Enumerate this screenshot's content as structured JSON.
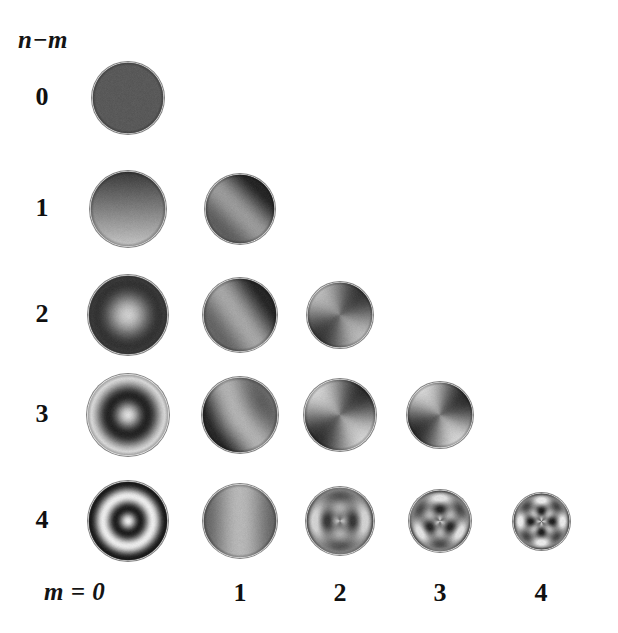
{
  "figure": {
    "type": "zernike-pyramid",
    "background_color": "#ffffff",
    "ink_color": "#101010",
    "width": 618,
    "height": 633
  },
  "axes": {
    "row_axis_title": "n−m",
    "col_axis_title": "m = 0",
    "row_ticks": [
      "0",
      "1",
      "2",
      "3",
      "4"
    ],
    "col_ticks": [
      "0",
      "1",
      "2",
      "3",
      "4"
    ],
    "col_tick_labels_shown": [
      "1",
      "2",
      "3",
      "4"
    ]
  },
  "grid": {
    "rows": 5,
    "cols": 5,
    "row_label_x": 42,
    "col_centers": [
      128,
      240,
      340,
      440,
      541
    ],
    "row_centers": [
      98,
      209,
      315,
      415,
      521
    ],
    "diameters": [
      [
        72,
        0,
        0,
        0,
        0
      ],
      [
        76,
        70,
        0,
        0,
        0
      ],
      [
        80,
        74,
        66,
        0,
        0
      ],
      [
        82,
        76,
        72,
        66,
        0
      ],
      [
        80,
        74,
        68,
        62,
        57
      ]
    ]
  },
  "chart_data": {
    "type": "heatmap",
    "title": "",
    "xlabel": "m",
    "ylabel": "n−m",
    "categories_x": [
      "0",
      "1",
      "2",
      "3",
      "4"
    ],
    "categories_y": [
      "0",
      "1",
      "2",
      "3",
      "4"
    ],
    "colormap": "grayscale",
    "value_range": [
      -1,
      1
    ],
    "cells": [
      {
        "row": 0,
        "col": 0,
        "n": 0,
        "m": 0,
        "name": "piston",
        "pattern": "uniform",
        "radial_order": 0,
        "azimuthal_order": 0,
        "radial_nodes": 0,
        "angular_lobes": 0,
        "mean_gray": 0.35,
        "contrast": 0.02,
        "phase_deg": 0
      },
      {
        "row": 1,
        "col": 0,
        "n": 1,
        "m": 0,
        "name": "tilt-vertical",
        "pattern": "linear-gradient",
        "radial_order": 1,
        "azimuthal_order": 0,
        "radial_nodes": 1,
        "angular_lobes": 0,
        "mean_gray": 0.5,
        "contrast": 0.55,
        "phase_deg": 90
      },
      {
        "row": 1,
        "col": 1,
        "n": 2,
        "m": 1,
        "name": "tilt-oblique",
        "pattern": "angular-band",
        "radial_order": 0,
        "azimuthal_order": 1,
        "radial_nodes": 0,
        "angular_lobes": 1,
        "mean_gray": 0.42,
        "contrast": 0.55,
        "phase_deg": 135
      },
      {
        "row": 2,
        "col": 0,
        "n": 2,
        "m": 0,
        "name": "defocus",
        "pattern": "radial-band",
        "radial_order": 1,
        "azimuthal_order": 0,
        "radial_nodes": 1,
        "angular_lobes": 0,
        "mean_gray": 0.5,
        "contrast": 0.6,
        "phase_deg": 90
      },
      {
        "row": 2,
        "col": 1,
        "n": 3,
        "m": 1,
        "name": "coma-oblique",
        "pattern": "angular-band",
        "radial_order": 1,
        "azimuthal_order": 1,
        "radial_nodes": 0,
        "angular_lobes": 1,
        "mean_gray": 0.45,
        "contrast": 0.6,
        "phase_deg": 145
      },
      {
        "row": 2,
        "col": 2,
        "n": 4,
        "m": 2,
        "name": "astigmatism-oblique",
        "pattern": "angular-cross",
        "radial_order": 0,
        "azimuthal_order": 2,
        "radial_nodes": 0,
        "angular_lobes": 2,
        "mean_gray": 0.47,
        "contrast": 0.55,
        "phase_deg": 45
      },
      {
        "row": 3,
        "col": 0,
        "n": 3,
        "m": 0,
        "name": "spherical-low",
        "pattern": "radial-band",
        "radial_order": 2,
        "azimuthal_order": 0,
        "radial_nodes": 2,
        "angular_lobes": 0,
        "mean_gray": 0.5,
        "contrast": 0.72,
        "phase_deg": 90
      },
      {
        "row": 3,
        "col": 1,
        "n": 4,
        "m": 1,
        "name": "coma-higher",
        "pattern": "angular-band",
        "radial_order": 2,
        "azimuthal_order": 1,
        "radial_nodes": 1,
        "angular_lobes": 1,
        "mean_gray": 0.48,
        "contrast": 0.65,
        "phase_deg": 150
      },
      {
        "row": 3,
        "col": 2,
        "n": 5,
        "m": 2,
        "name": "astigmatism-higher",
        "pattern": "angular-cross",
        "radial_order": 1,
        "azimuthal_order": 2,
        "radial_nodes": 0,
        "angular_lobes": 2,
        "mean_gray": 0.5,
        "contrast": 0.68,
        "phase_deg": 45
      },
      {
        "row": 3,
        "col": 3,
        "n": 6,
        "m": 3,
        "name": "trefoil",
        "pattern": "angular-cross-offset",
        "radial_order": 1,
        "azimuthal_order": 2,
        "radial_nodes": 0,
        "angular_lobes": 2,
        "mean_gray": 0.5,
        "contrast": 0.7,
        "phase_deg": 55
      },
      {
        "row": 4,
        "col": 0,
        "n": 4,
        "m": 0,
        "name": "spherical-aberration",
        "pattern": "radial-band",
        "radial_order": 3,
        "azimuthal_order": 0,
        "radial_nodes": 3,
        "angular_lobes": 0,
        "mean_gray": 0.52,
        "contrast": 0.8,
        "phase_deg": 90
      },
      {
        "row": 4,
        "col": 1,
        "n": 5,
        "m": 1,
        "name": "coma-highest",
        "pattern": "angular-band-soft",
        "radial_order": 3,
        "azimuthal_order": 1,
        "radial_nodes": 1,
        "angular_lobes": 1,
        "mean_gray": 0.55,
        "contrast": 0.42,
        "phase_deg": 180
      },
      {
        "row": 4,
        "col": 2,
        "n": 6,
        "m": 2,
        "name": "secondary-astigmatism",
        "pattern": "lattice",
        "radial_order": 2,
        "azimuthal_order": 2,
        "radial_nodes": 1,
        "angular_lobes": 2,
        "mean_gray": 0.52,
        "contrast": 0.6,
        "phase_deg": 0
      },
      {
        "row": 4,
        "col": 3,
        "n": 7,
        "m": 3,
        "name": "secondary-trefoil",
        "pattern": "lattice",
        "radial_order": 2,
        "azimuthal_order": 3,
        "radial_nodes": 1,
        "angular_lobes": 3,
        "mean_gray": 0.52,
        "contrast": 0.72,
        "phase_deg": 30
      },
      {
        "row": 4,
        "col": 4,
        "n": 8,
        "m": 4,
        "name": "quadrafoil",
        "pattern": "lattice",
        "radial_order": 2,
        "azimuthal_order": 4,
        "radial_nodes": 1,
        "angular_lobes": 4,
        "mean_gray": 0.52,
        "contrast": 0.78,
        "phase_deg": 0
      }
    ]
  }
}
